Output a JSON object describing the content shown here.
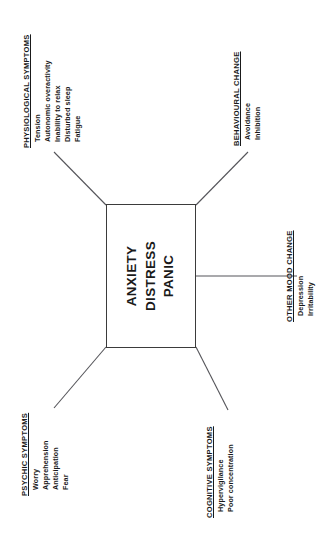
{
  "diagram": {
    "orientation": "rotated-90-ccw",
    "center": {
      "lines": [
        "ANXIETY",
        "DISTRESS",
        "PANIC"
      ]
    },
    "groups": [
      {
        "id": "physiological-symptoms",
        "title": "PHYSIOLOGICAL SYMPTOMS",
        "items": [
          "Tension",
          "Autonomic overactivity",
          "Inability to relax",
          "Disturbed sleep",
          "Fatigue"
        ]
      },
      {
        "id": "behavioural-change",
        "title": "BEHAVIOURAL CHANGE",
        "items": [
          "Avoidance",
          "Inhibition"
        ]
      },
      {
        "id": "other-mood-change",
        "title": "OTHER MOOD CHANGE",
        "items": [
          "Depression",
          "Irritability"
        ]
      },
      {
        "id": "psychic-symptoms",
        "title": "PSYCHIC SYMPTOMS",
        "items": [
          "Worry",
          "Apprehension",
          "Anticipation",
          "Fear"
        ]
      },
      {
        "id": "cognitive-symptoms",
        "title": "COGNITIVE SYMPTOMS",
        "items": [
          "Hypervigilance",
          "Poor concentration"
        ]
      }
    ],
    "colors": {
      "line": "#55555a",
      "box_border": "#3b3b3b",
      "text": "#1a1a1a",
      "background": "#ffffff"
    }
  }
}
